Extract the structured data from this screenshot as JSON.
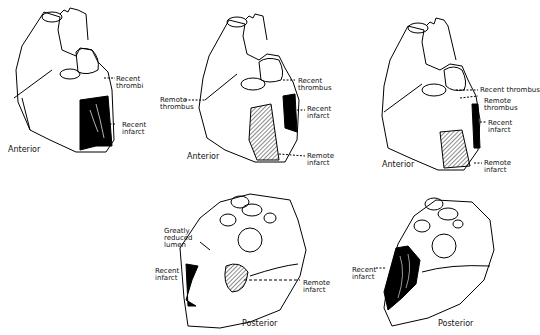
{
  "figure": {
    "panels": [
      {
        "id": "anterior-1",
        "view": "Anterior",
        "labels": [
          "Recent\nthrombi",
          "Recent\ninfarct"
        ]
      },
      {
        "id": "anterior-2",
        "view": "Anterior",
        "labels": [
          "Recent\nthrombus",
          "Remote\nthrombus",
          "Recent\ninfarct",
          "Remote\ninfarct"
        ]
      },
      {
        "id": "anterior-3",
        "view": "Anterior",
        "labels": [
          "Recent thrombus",
          "Remote\nthrombus",
          "Recent\ninfarct",
          "Remote\ninfarct"
        ]
      },
      {
        "id": "posterior-1",
        "view": "Posterior",
        "labels": [
          "Greatly\nreduced\nlumen",
          "Recent\ninfarct",
          "Remote\ninfarct"
        ]
      },
      {
        "id": "posterior-2",
        "view": "Posterior",
        "labels": [
          "Recent\ninfarct"
        ]
      }
    ],
    "colors": {
      "ink": "#000000",
      "background": "#ffffff"
    }
  }
}
